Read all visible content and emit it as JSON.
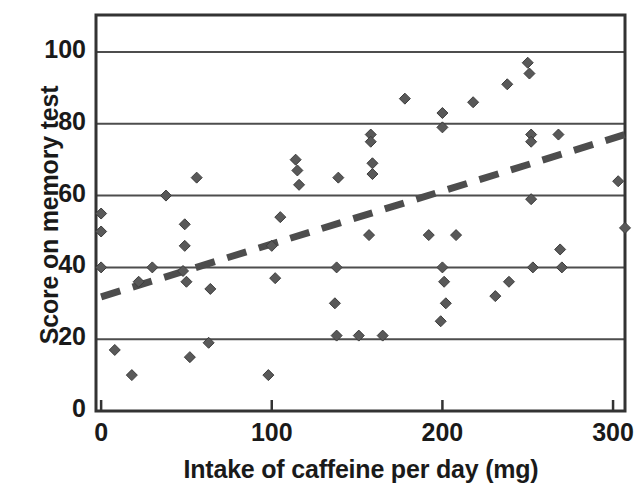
{
  "chart_data": {
    "type": "scatter",
    "title": "",
    "xlabel": "Intake of caffeine per day (mg)",
    "ylabel": "Score on memory test",
    "xlim": [
      -3,
      307
    ],
    "ylim": [
      0,
      110.3
    ],
    "xticks": [
      0,
      100,
      200,
      300
    ],
    "yticks": [
      0,
      20,
      40,
      60,
      80,
      100
    ],
    "xtick_labels": [
      "0",
      "100",
      "200",
      "300"
    ],
    "ytick_labels": [
      "0",
      "20",
      "40",
      "60",
      "80",
      "100"
    ],
    "grid": "horizontal",
    "legend": "none",
    "marker": "diamond",
    "marker_color": "#595959",
    "marker_size": 11,
    "frame_color": "#333333",
    "gridline_color": "#4d4d4d",
    "points": [
      {
        "x": 0,
        "y": 55
      },
      {
        "x": 0,
        "y": 50
      },
      {
        "x": 0,
        "y": 40
      },
      {
        "x": 8,
        "y": 17
      },
      {
        "x": 18,
        "y": 10
      },
      {
        "x": 22,
        "y": 36
      },
      {
        "x": 30,
        "y": 40
      },
      {
        "x": 38,
        "y": 60
      },
      {
        "x": 48,
        "y": 39
      },
      {
        "x": 49,
        "y": 52
      },
      {
        "x": 49,
        "y": 46
      },
      {
        "x": 50,
        "y": 36
      },
      {
        "x": 52,
        "y": 15
      },
      {
        "x": 56,
        "y": 65
      },
      {
        "x": 63,
        "y": 19
      },
      {
        "x": 64,
        "y": 34
      },
      {
        "x": 98,
        "y": 10
      },
      {
        "x": 100,
        "y": 46
      },
      {
        "x": 102,
        "y": 37
      },
      {
        "x": 105,
        "y": 54
      },
      {
        "x": 114,
        "y": 70
      },
      {
        "x": 115,
        "y": 67
      },
      {
        "x": 116,
        "y": 63
      },
      {
        "x": 137,
        "y": 30
      },
      {
        "x": 138,
        "y": 40
      },
      {
        "x": 138,
        "y": 21
      },
      {
        "x": 139,
        "y": 65
      },
      {
        "x": 151,
        "y": 21
      },
      {
        "x": 157,
        "y": 49
      },
      {
        "x": 158,
        "y": 77
      },
      {
        "x": 158,
        "y": 75
      },
      {
        "x": 159,
        "y": 69
      },
      {
        "x": 159,
        "y": 66
      },
      {
        "x": 165,
        "y": 21
      },
      {
        "x": 178,
        "y": 87
      },
      {
        "x": 192,
        "y": 49
      },
      {
        "x": 199,
        "y": 25
      },
      {
        "x": 200,
        "y": 83
      },
      {
        "x": 200,
        "y": 79
      },
      {
        "x": 200,
        "y": 40
      },
      {
        "x": 201,
        "y": 36
      },
      {
        "x": 202,
        "y": 30
      },
      {
        "x": 208,
        "y": 49
      },
      {
        "x": 218,
        "y": 86
      },
      {
        "x": 231,
        "y": 32
      },
      {
        "x": 238,
        "y": 91
      },
      {
        "x": 239,
        "y": 36
      },
      {
        "x": 250,
        "y": 97
      },
      {
        "x": 251,
        "y": 94
      },
      {
        "x": 252,
        "y": 77
      },
      {
        "x": 252,
        "y": 75
      },
      {
        "x": 252,
        "y": 59
      },
      {
        "x": 253,
        "y": 40
      },
      {
        "x": 268,
        "y": 77
      },
      {
        "x": 269,
        "y": 45
      },
      {
        "x": 270,
        "y": 40
      },
      {
        "x": 303,
        "y": 64
      },
      {
        "x": 307,
        "y": 51
      }
    ],
    "trendline": {
      "style": "dashed",
      "color": "#4d4d4d",
      "width": 7,
      "x0": 0,
      "y0": 31.8,
      "x1": 307,
      "y1": 77
    }
  }
}
